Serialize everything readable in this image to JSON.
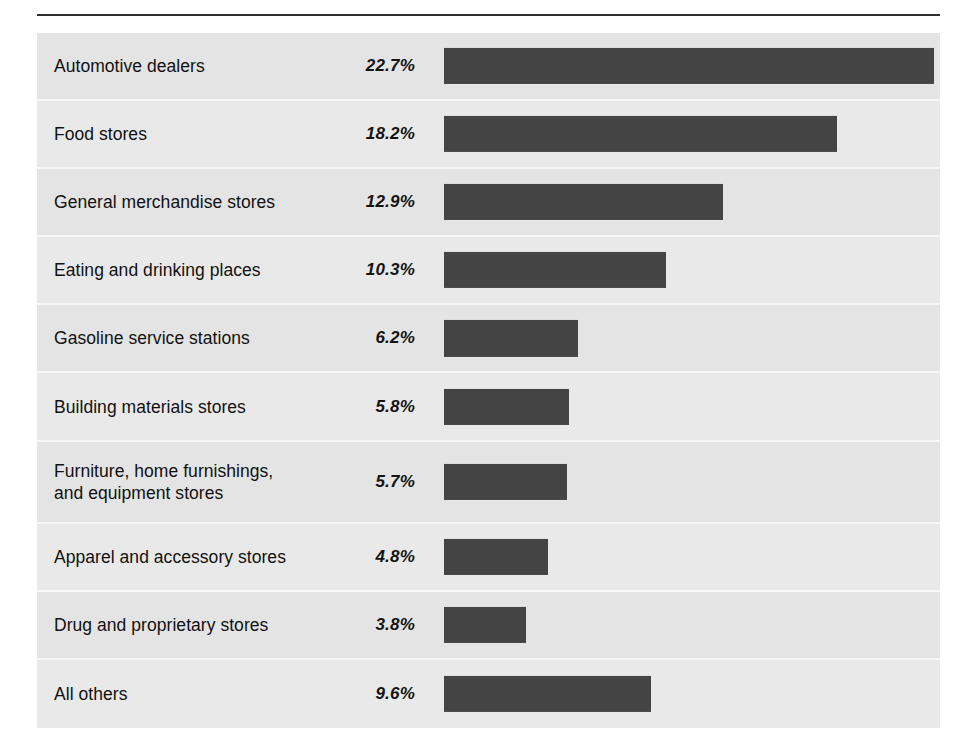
{
  "figure": {
    "background_color": "#ffffff",
    "panel_color": "#e4e4e4",
    "panel_alt_color": "#e9e9e9",
    "bar_color": "#444444",
    "rule_color": "#2e2e2e",
    "separator_color": "#f7f7f7",
    "text_color": "#111111"
  },
  "chart_data": {
    "type": "bar",
    "orientation": "horizontal",
    "title": "",
    "subtitle": "",
    "xlabel": "",
    "ylabel": "",
    "xlim": [
      0,
      22.7
    ],
    "grid": false,
    "legend": null,
    "value_suffix": "%",
    "px_per_percent": 21.6,
    "categories": [
      "Automotive dealers",
      "Food stores",
      "General merchandise stores",
      "Eating and drinking places",
      "Gasoline service stations",
      "Building materials stores",
      "Furniture, home furnishings,\nand equipment stores",
      "Apparel and accessory stores",
      "Drug and proprietary stores",
      "All others"
    ],
    "values": [
      22.7,
      18.2,
      12.9,
      10.3,
      6.2,
      5.8,
      5.7,
      4.8,
      3.8,
      9.6
    ],
    "value_labels": [
      "22.7%",
      "18.2%",
      "12.9%",
      "10.3%",
      "6.2%",
      "5.8%",
      "5.7%",
      "4.8%",
      "3.8%",
      "9.6%"
    ],
    "rows": [
      {
        "label": "Automotive dealers",
        "value": 22.7,
        "value_label": "22.7%",
        "two_line": false
      },
      {
        "label": "Food stores",
        "value": 18.2,
        "value_label": "18.2%",
        "two_line": false
      },
      {
        "label": "General merchandise stores",
        "value": 12.9,
        "value_label": "12.9%",
        "two_line": false
      },
      {
        "label": "Eating and drinking places",
        "value": 10.3,
        "value_label": "10.3%",
        "two_line": false
      },
      {
        "label": "Gasoline service stations",
        "value": 6.2,
        "value_label": "6.2%",
        "two_line": false
      },
      {
        "label": "Building materials stores",
        "value": 5.8,
        "value_label": "5.8%",
        "two_line": false
      },
      {
        "label": "Furniture, home furnishings,\nand equipment stores",
        "value": 5.7,
        "value_label": "5.7%",
        "two_line": true
      },
      {
        "label": "Apparel and accessory stores",
        "value": 4.8,
        "value_label": "4.8%",
        "two_line": false
      },
      {
        "label": "Drug and proprietary stores",
        "value": 3.8,
        "value_label": "3.8%",
        "two_line": false
      },
      {
        "label": "All others",
        "value": 9.6,
        "value_label": "9.6%",
        "two_line": false
      }
    ]
  }
}
